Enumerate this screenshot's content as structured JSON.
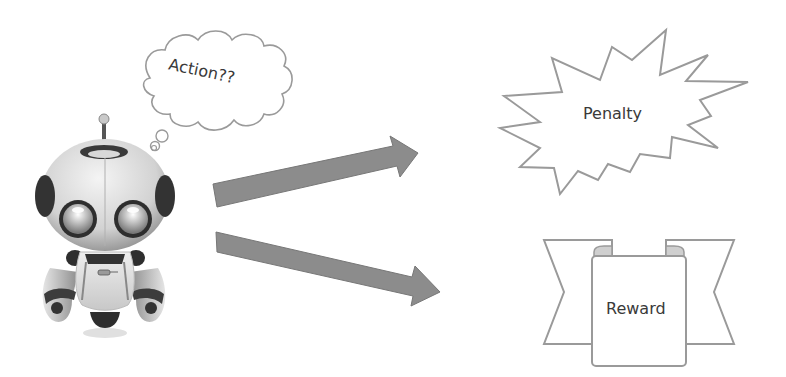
{
  "diagram": {
    "agent": {
      "icon": "robot-icon",
      "thought": "Action??"
    },
    "arrows": [
      {
        "name": "arrow-to-penalty",
        "color": "#8c8c8c"
      },
      {
        "name": "arrow-to-reward",
        "color": "#8c8c8c"
      }
    ],
    "outcomes": {
      "penalty": {
        "label": "Penalty",
        "shape": "explosion-burst"
      },
      "reward": {
        "label": "Reward",
        "shape": "ribbon-banner"
      }
    },
    "colors": {
      "outline": "#9a9a9a",
      "arrow_fill": "#8c8c8c",
      "text": "#3a3a3a",
      "robot_dark": "#3c3c3c"
    }
  }
}
